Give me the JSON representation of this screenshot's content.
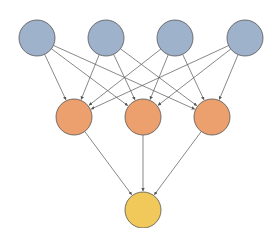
{
  "diagram": {
    "type": "neural-network",
    "colors": {
      "input": "#9fb2cc",
      "hidden": "#eca06e",
      "output": "#f1c85a",
      "stroke": "#555555",
      "edge": "#555555"
    },
    "layers": [
      {
        "name": "input",
        "nodes": [
          {
            "id": "i1",
            "x": 37,
            "y": 38
          },
          {
            "id": "i2",
            "x": 106,
            "y": 38
          },
          {
            "id": "i3",
            "x": 175,
            "y": 38
          },
          {
            "id": "i4",
            "x": 245,
            "y": 38
          }
        ]
      },
      {
        "name": "hidden",
        "nodes": [
          {
            "id": "h1",
            "x": 74,
            "y": 117
          },
          {
            "id": "h2",
            "x": 143,
            "y": 117
          },
          {
            "id": "h3",
            "x": 212,
            "y": 117
          }
        ]
      },
      {
        "name": "output",
        "nodes": [
          {
            "id": "o1",
            "x": 143,
            "y": 210
          }
        ]
      }
    ],
    "radius": 18
  }
}
